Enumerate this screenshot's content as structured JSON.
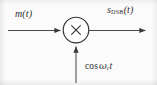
{
  "figure": {
    "name": "DSB modulator block diagram",
    "width": 157,
    "height": 85,
    "background_color": "#fbfbfb",
    "stroke_color": "#3a3a3a",
    "text_color": "#2e2e2e"
  },
  "labels": {
    "input_signal": "m(t)",
    "input_signal_base": "m",
    "input_signal_arg": "(t)",
    "output_signal": "s_DSB(t)",
    "output_signal_base": "s",
    "output_signal_subscript": "DSB",
    "output_signal_arg": "(t)",
    "carrier": "cos ωc t",
    "carrier_function": "cos",
    "carrier_omega": "ω",
    "carrier_subscript": "c",
    "carrier_time": "t"
  },
  "block": {
    "type": "multiplier",
    "symbol": "×",
    "shape": "circle",
    "center_x": 76,
    "center_y": 30,
    "radius": 13
  },
  "connections": [
    {
      "name": "message-input-arrow",
      "direction": "right",
      "from_x": 8,
      "to_x": 63,
      "y": 30,
      "label": "m(t)"
    },
    {
      "name": "dsb-output-arrow",
      "direction": "right",
      "from_x": 89,
      "to_x": 148,
      "y": 30,
      "label": "s_DSB(t)"
    },
    {
      "name": "carrier-input-arrow",
      "direction": "up",
      "x": 76,
      "from_y": 83,
      "to_y": 44,
      "label": "cos ωc t"
    }
  ]
}
